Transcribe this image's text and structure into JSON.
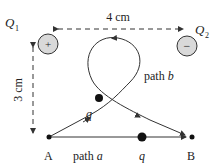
{
  "charges": {
    "q1": {
      "label": "Q",
      "sub": "1",
      "sign": "+"
    },
    "q2": {
      "label": "Q",
      "sub": "2",
      "sign": "−"
    }
  },
  "dimensions": {
    "horizontal": "4 cm",
    "vertical": "3 cm"
  },
  "points": {
    "a": "A",
    "b": "B"
  },
  "paths": {
    "a": {
      "prefix": "path ",
      "var": "a"
    },
    "b": {
      "prefix": "path ",
      "var": "b"
    }
  },
  "test_charge": "q",
  "colors": {
    "charge_fill": "#d9d9d9",
    "line": "#333333"
  }
}
